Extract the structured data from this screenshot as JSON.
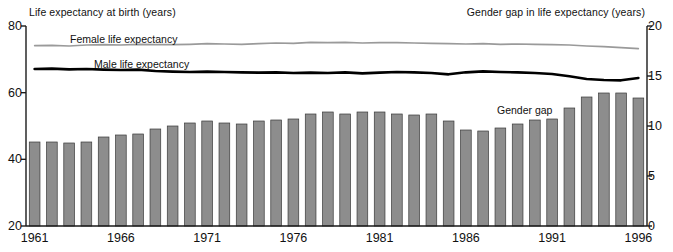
{
  "chart_data": {
    "type": "bar",
    "title": "",
    "subtitle": "",
    "left_axis_title": "Life expectancy at birth (years)",
    "right_axis_title": "Gender gap in life expectancy (years)",
    "xlabel": "",
    "ylabel": "Life expectancy at birth (years)",
    "y2label": "Gender gap in life expectancy (years)",
    "ylim": [
      20,
      80
    ],
    "y2lim": [
      0,
      20
    ],
    "yticks": [
      20,
      40,
      60,
      80
    ],
    "y2ticks": [
      0,
      5,
      10,
      15,
      20
    ],
    "grid": false,
    "legend_position": "inline-annotations",
    "categories": [
      1961,
      1962,
      1963,
      1964,
      1965,
      1966,
      1967,
      1968,
      1969,
      1970,
      1971,
      1972,
      1973,
      1974,
      1975,
      1976,
      1977,
      1978,
      1979,
      1980,
      1981,
      1982,
      1983,
      1984,
      1985,
      1986,
      1987,
      1988,
      1989,
      1990,
      1991,
      1992,
      1993,
      1994,
      1995,
      1996
    ],
    "xtick_labels": [
      "1961",
      "1966",
      "1971",
      "1976",
      "1981",
      "1986",
      "1991",
      "1996"
    ],
    "xtick_values": [
      1961,
      1966,
      1971,
      1976,
      1981,
      1986,
      1991,
      1996
    ],
    "series": [
      {
        "name": "Gender gap",
        "type": "bar",
        "axis": "right",
        "units": "years",
        "color": "#8d8d8d",
        "values": [
          8.4,
          8.4,
          8.3,
          8.4,
          8.9,
          9.1,
          9.2,
          9.7,
          10.0,
          10.3,
          10.5,
          10.3,
          10.2,
          10.5,
          10.6,
          10.7,
          11.2,
          11.4,
          11.2,
          11.4,
          11.4,
          11.2,
          11.1,
          11.2,
          10.5,
          9.6,
          9.5,
          9.8,
          10.2,
          10.6,
          10.7,
          11.8,
          12.9,
          13.3,
          13.3,
          12.8
        ]
      },
      {
        "name": "Female life expectancy",
        "type": "line",
        "axis": "left",
        "units": "years",
        "color": "#9a9a9a",
        "values": [
          74.1,
          74.2,
          74.0,
          74.3,
          74.4,
          74.3,
          74.5,
          74.4,
          74.4,
          74.5,
          74.7,
          74.6,
          74.5,
          74.7,
          74.9,
          74.8,
          75.1,
          75.0,
          75.1,
          74.9,
          75.0,
          75.0,
          74.9,
          74.8,
          74.7,
          74.6,
          74.7,
          74.5,
          74.6,
          74.5,
          74.4,
          74.3,
          74.0,
          73.8,
          73.5,
          73.2
        ]
      },
      {
        "name": "Male life expectancy",
        "type": "line",
        "axis": "left",
        "units": "years",
        "color": "#000000",
        "values": [
          67.1,
          67.2,
          67.0,
          67.1,
          66.9,
          66.8,
          66.9,
          66.5,
          66.3,
          66.2,
          66.3,
          66.2,
          66.1,
          66.0,
          66.1,
          65.9,
          66.0,
          65.9,
          66.1,
          65.8,
          66.0,
          66.2,
          66.1,
          65.9,
          65.5,
          66.1,
          66.4,
          66.2,
          66.1,
          65.9,
          65.6,
          64.9,
          64.1,
          63.8,
          63.7,
          64.4
        ]
      }
    ],
    "annotations": [
      {
        "name": "female-line-label",
        "text": "Female life expectancy"
      },
      {
        "name": "male-line-label",
        "text": "Male life expectancy"
      },
      {
        "name": "gender-gap-label",
        "text": "Gender gap"
      }
    ]
  }
}
